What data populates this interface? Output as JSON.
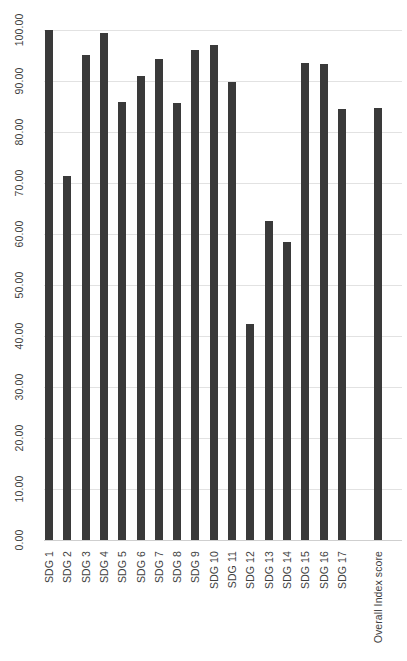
{
  "chart_data": {
    "type": "bar",
    "title": "",
    "subtitle": "",
    "xlabel": "",
    "ylabel": "",
    "ylim": [
      0,
      100
    ],
    "ytick_step": 10,
    "grid": true,
    "legend": null,
    "legend_position": "none",
    "bar_color": "#3a3a3a",
    "gridline_color": "#e2e2e2",
    "categories": [
      "SDG 1",
      "SDG 2",
      "SDG 3",
      "SDG 4",
      "SDG 5",
      "SDG 6",
      "SDG 7",
      "SDG 8",
      "SDG 9",
      "SDG 10",
      "SDG 11",
      "SDG 12",
      "SDG 13",
      "SDG 14",
      "SDG 15",
      "SDG 16",
      "SDG 17",
      "Overall Index score"
    ],
    "values": [
      100.0,
      71.4,
      95.1,
      99.4,
      85.8,
      90.9,
      94.3,
      85.6,
      96.1,
      97.0,
      89.8,
      42.3,
      62.5,
      58.4,
      93.5,
      93.4,
      84.5,
      84.8
    ],
    "ytick_labels": [
      "0.00",
      "10.00",
      "20.00",
      "30.00",
      "40.00",
      "50.00",
      "60.00",
      "70.00",
      "80.00",
      "90.00",
      "100.00"
    ],
    "ytick_values": [
      0,
      10,
      20,
      30,
      40,
      50,
      60,
      70,
      80,
      90,
      100
    ],
    "gap_before_last": true
  }
}
